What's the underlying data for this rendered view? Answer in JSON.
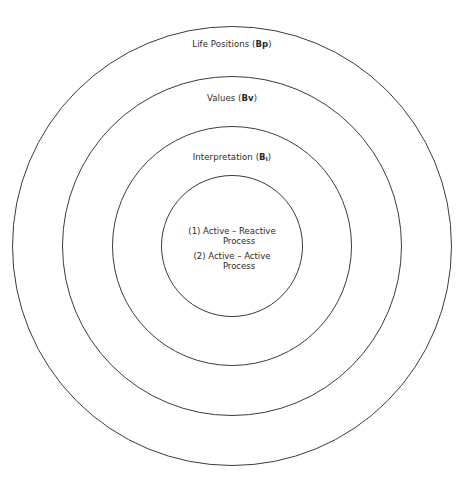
{
  "diagram": {
    "type": "concentric-circles",
    "center": {
      "x": 232,
      "y": 246
    },
    "stroke_color": "#3a3a3a",
    "rings": [
      {
        "level": 1,
        "radius": 220,
        "label_prefix": "Life Positions (",
        "label_symbol": "Bp",
        "label_subscript": "",
        "label_suffix": ")"
      },
      {
        "level": 2,
        "radius": 170,
        "label_prefix": "Values (",
        "label_symbol": "Bv",
        "label_subscript": "",
        "label_suffix": ")"
      },
      {
        "level": 3,
        "radius": 120,
        "label_prefix": "Interpretation (",
        "label_symbol": "B",
        "label_subscript": "I",
        "label_suffix": ")"
      },
      {
        "level": 4,
        "radius": 71
      }
    ],
    "core_items": [
      {
        "number": "(1)",
        "line1": "Active – Reactive",
        "line2": "Process"
      },
      {
        "number": "(2)",
        "line1": "Active – Active",
        "line2": "Process"
      }
    ]
  }
}
